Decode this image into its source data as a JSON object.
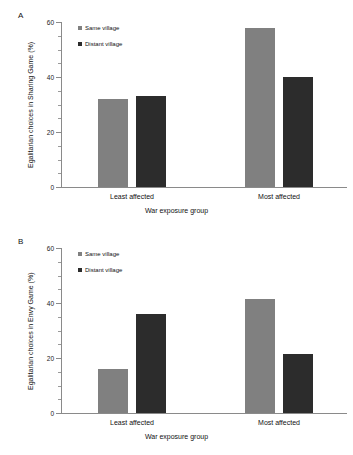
{
  "figure": {
    "panels": [
      {
        "letter": "A",
        "chart_index": 0
      },
      {
        "letter": "B",
        "chart_index": 1
      }
    ]
  },
  "chart_data": [
    {
      "type": "bar",
      "title": "",
      "panel_letter": "A",
      "categories": [
        "Least affected",
        "Most affected"
      ],
      "series": [
        {
          "name": "Same village",
          "values": [
            32,
            58
          ],
          "color": "#808080"
        },
        {
          "name": "Distant village",
          "values": [
            33,
            40
          ],
          "color": "#2c2c2c"
        }
      ],
      "xlabel": "War exposure group",
      "ylabel": "Egalitarian choices in Sharing Game (%)",
      "ylim": [
        0,
        60
      ],
      "yticks": [
        0,
        20,
        40,
        60
      ],
      "ytick_labels": [
        "0",
        "20",
        "40",
        "60"
      ],
      "yminor_step": 5,
      "grid": false,
      "legend_position": "top-left"
    },
    {
      "type": "bar",
      "title": "",
      "panel_letter": "B",
      "categories": [
        "Least affected",
        "Most affected"
      ],
      "series": [
        {
          "name": "Same village",
          "values": [
            16,
            41.5
          ],
          "color": "#808080"
        },
        {
          "name": "Distant village",
          "values": [
            36,
            21.5
          ],
          "color": "#2c2c2c"
        }
      ],
      "xlabel": "War exposure group",
      "ylabel": "Egalitarian choices in Envy Game (%)",
      "ylim": [
        0,
        60
      ],
      "yticks": [
        0,
        20,
        40,
        60
      ],
      "ytick_labels": [
        "0",
        "20",
        "40",
        "60"
      ],
      "yminor_step": 5,
      "grid": false,
      "legend_position": "top-left"
    }
  ]
}
